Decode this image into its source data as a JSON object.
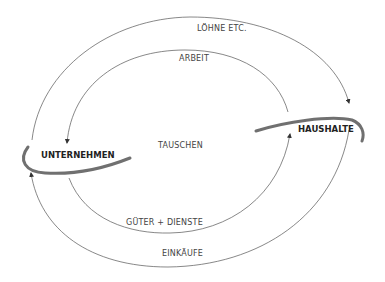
{
  "diagram": {
    "type": "circular-flow",
    "nodes": {
      "firms": "UNTERNEHMEN",
      "households": "HAUSHALTE"
    },
    "center_label": "TAUSCHEN",
    "flows": {
      "wages": "LÖHNE ETC.",
      "labor": "ARBEIT",
      "goods_services": "GÜTER + DIENSTE",
      "purchases": "EINKÄUFE"
    },
    "colors": {
      "node_arc": "#707070",
      "flow_line": "#555555",
      "text": "#444444"
    }
  }
}
